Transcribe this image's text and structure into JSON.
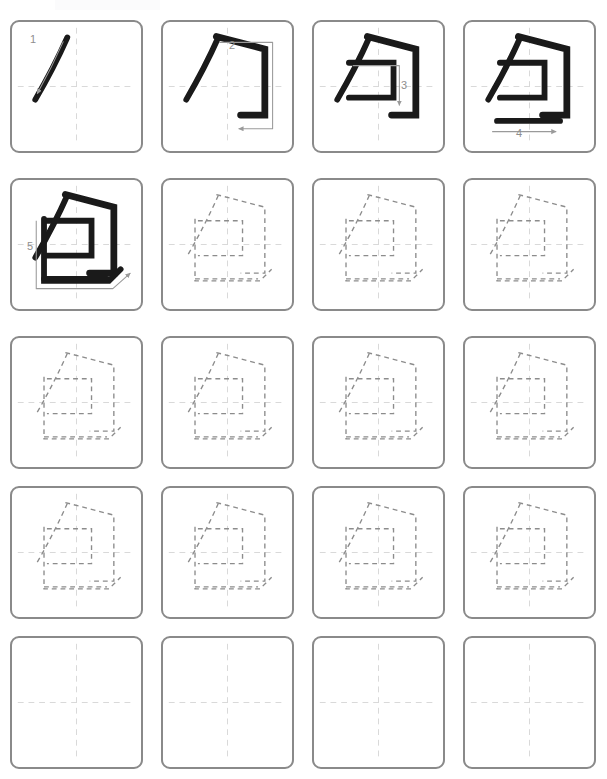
{
  "worksheet": {
    "title": "Chinese Character Stroke Order Practice",
    "character": "包",
    "character_romanization": "bao",
    "total_strokes": 5,
    "columns": 4,
    "rows": 5,
    "paper_color": "#ffffff",
    "cell_border_color": "#8a8a8a",
    "guide_line_color": "#d8d8d8",
    "ink_color": "#1a1a1a",
    "trace_color": "#8c8c8c",
    "hint_arrow_color": "#9a9a9a",
    "stroke_label_color": "#8e8e8e"
  },
  "strokes": [
    {
      "order": 1,
      "label": "1",
      "name": "pie",
      "description": "left-falling stroke",
      "label_x": 30,
      "label_y": 34
    },
    {
      "order": 2,
      "label": "2",
      "name": "heng-zhe-gou",
      "description": "horizontal turning hook",
      "label_x": 229,
      "label_y": 40
    },
    {
      "order": 3,
      "label": "3",
      "name": "heng-zhe",
      "description": "horizontal turn inside",
      "label_x": 401,
      "label_y": 80
    },
    {
      "order": 4,
      "label": "4",
      "name": "heng",
      "description": "horizontal stroke",
      "label_x": 516,
      "label_y": 128
    },
    {
      "order": 5,
      "label": "5",
      "name": "shu-wan-gou",
      "description": "vertical bend hook",
      "label_x": 27,
      "label_y": 241
    }
  ],
  "cells": [
    {
      "index": 1,
      "row": 1,
      "col": 1,
      "x": 10,
      "y": 20,
      "mode": "demo",
      "strokes_shown": 1,
      "active_stroke": 1
    },
    {
      "index": 2,
      "row": 1,
      "col": 2,
      "x": 161,
      "y": 20,
      "mode": "demo",
      "strokes_shown": 2,
      "active_stroke": 2
    },
    {
      "index": 3,
      "row": 1,
      "col": 3,
      "x": 312,
      "y": 20,
      "mode": "demo",
      "strokes_shown": 3,
      "active_stroke": 3
    },
    {
      "index": 4,
      "row": 1,
      "col": 4,
      "x": 463,
      "y": 20,
      "mode": "demo",
      "strokes_shown": 4,
      "active_stroke": 4
    },
    {
      "index": 5,
      "row": 2,
      "col": 1,
      "x": 10,
      "y": 178,
      "mode": "demo",
      "strokes_shown": 5,
      "active_stroke": 5
    },
    {
      "index": 6,
      "row": 2,
      "col": 2,
      "x": 161,
      "y": 178,
      "mode": "trace",
      "strokes_shown": 5,
      "active_stroke": 0
    },
    {
      "index": 7,
      "row": 2,
      "col": 3,
      "x": 312,
      "y": 178,
      "mode": "trace",
      "strokes_shown": 5,
      "active_stroke": 0
    },
    {
      "index": 8,
      "row": 2,
      "col": 4,
      "x": 463,
      "y": 178,
      "mode": "trace",
      "strokes_shown": 5,
      "active_stroke": 0
    },
    {
      "index": 9,
      "row": 3,
      "col": 1,
      "x": 10,
      "y": 336,
      "mode": "trace",
      "strokes_shown": 5,
      "active_stroke": 0
    },
    {
      "index": 10,
      "row": 3,
      "col": 2,
      "x": 161,
      "y": 336,
      "mode": "trace",
      "strokes_shown": 5,
      "active_stroke": 0
    },
    {
      "index": 11,
      "row": 3,
      "col": 3,
      "x": 312,
      "y": 336,
      "mode": "trace",
      "strokes_shown": 5,
      "active_stroke": 0
    },
    {
      "index": 12,
      "row": 3,
      "col": 4,
      "x": 463,
      "y": 336,
      "mode": "trace",
      "strokes_shown": 5,
      "active_stroke": 0
    },
    {
      "index": 13,
      "row": 4,
      "col": 1,
      "x": 10,
      "y": 486,
      "mode": "trace",
      "strokes_shown": 5,
      "active_stroke": 0
    },
    {
      "index": 14,
      "row": 4,
      "col": 2,
      "x": 161,
      "y": 486,
      "mode": "trace",
      "strokes_shown": 5,
      "active_stroke": 0
    },
    {
      "index": 15,
      "row": 4,
      "col": 3,
      "x": 312,
      "y": 486,
      "mode": "trace",
      "strokes_shown": 5,
      "active_stroke": 0
    },
    {
      "index": 16,
      "row": 4,
      "col": 4,
      "x": 463,
      "y": 486,
      "mode": "trace",
      "strokes_shown": 5,
      "active_stroke": 0
    },
    {
      "index": 17,
      "row": 5,
      "col": 1,
      "x": 10,
      "y": 636,
      "mode": "blank",
      "strokes_shown": 0,
      "active_stroke": 0
    },
    {
      "index": 18,
      "row": 5,
      "col": 2,
      "x": 161,
      "y": 636,
      "mode": "blank",
      "strokes_shown": 0,
      "active_stroke": 0
    },
    {
      "index": 19,
      "row": 5,
      "col": 3,
      "x": 312,
      "y": 636,
      "mode": "blank",
      "strokes_shown": 0,
      "active_stroke": 0
    },
    {
      "index": 20,
      "row": 5,
      "col": 4,
      "x": 463,
      "y": 636,
      "mode": "blank",
      "strokes_shown": 0,
      "active_stroke": 0
    }
  ],
  "glyph_paths": {
    "stroke1": "M 57 16 C 49 34 38 56 24 80",
    "stroke2": "M 55 15 L 105 28 L 105 96 L 80 96",
    "stroke3": "M 36 42 L 82 42 L 82 78 L 36 78",
    "stroke4": "M 33 102 L 98 102",
    "stroke5": "M 33 40 L 33 104 L 100 104 L 112 92"
  },
  "hints": {
    "arrow1": {
      "name": "stroke-1-direction-arrow",
      "path": "M 53 20 C 45 38 36 56 26 74"
    },
    "arrow2": {
      "name": "stroke-2-direction-arrow",
      "path": "M 58 21 L 113 21 L 113 110 L 78 110"
    },
    "arrow3": {
      "name": "stroke-3-direction-arrow",
      "path": "M 40 45 L 88 45 L 88 86"
    },
    "arrow4": {
      "name": "stroke-4-direction-arrow",
      "path": "M 28 113 L 94 113"
    },
    "arrow5": {
      "name": "stroke-5-direction-arrow",
      "path": "M 25 42 L 25 112 L 104 112 L 122 96"
    }
  }
}
